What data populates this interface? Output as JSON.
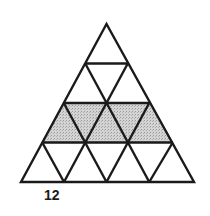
{
  "figure": {
    "label": "12",
    "rows": 4,
    "shaded_row": 3,
    "shaded_triangle_count": 5,
    "colors": {
      "stroke": "#1a1a1a",
      "shade": "#c8c8c8",
      "background": "#ffffff"
    }
  }
}
